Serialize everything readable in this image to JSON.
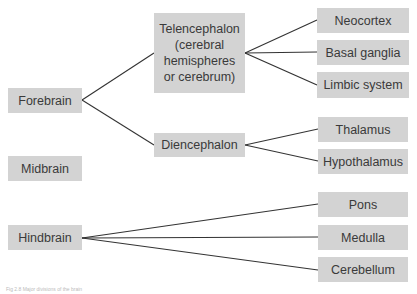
{
  "nodes": {
    "forebrain": "Forebrain",
    "midbrain": "Midbrain",
    "hindbrain": "Hindbrain",
    "telencephalon": "Telencephalon (cerebral hemispheres or cerebrum)",
    "diencephalon": "Diencephalon",
    "neocortex": "Neocortex",
    "basal_ganglia": "Basal ganglia",
    "limbic_system": "Limbic system",
    "thalamus": "Thalamus",
    "hypothalamus": "Hypothalamus",
    "pons": "Pons",
    "medulla": "Medulla",
    "cerebellum": "Cerebellum"
  },
  "caption": "Fig 2.8 Major divisions of the brain",
  "colors": {
    "box": "#d3d3d3",
    "line": "#333333"
  }
}
